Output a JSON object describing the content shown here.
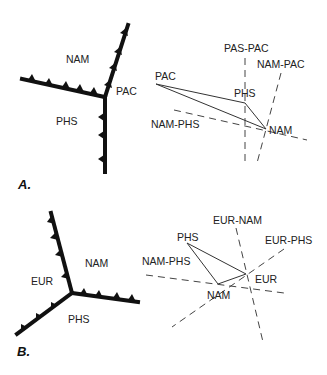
{
  "figure": {
    "panel_a": {
      "label": "A.",
      "map": {
        "plates": {
          "nam": "NAM",
          "pac": "PAC",
          "phs": "PHS"
        }
      },
      "velocity_triangle": {
        "points": {
          "pac": "PAC",
          "phs": "PHS",
          "nam": "NAM"
        },
        "boundaries": {
          "pas_pac": "PAS-PAC",
          "nam_pac": "NAM-PAC",
          "nam_phs": "NAM-PHS"
        }
      }
    },
    "panel_b": {
      "label": "B.",
      "map": {
        "plates": {
          "eur": "EUR",
          "nam": "NAM",
          "phs": "PHS"
        }
      },
      "velocity_triangle": {
        "points": {
          "phs": "PHS",
          "nam": "NAM",
          "eur": "EUR"
        },
        "boundaries": {
          "eur_nam": "EUR-NAM",
          "eur_phs": "EUR-PHS",
          "nam_phs": "NAM-PHS"
        }
      }
    }
  }
}
